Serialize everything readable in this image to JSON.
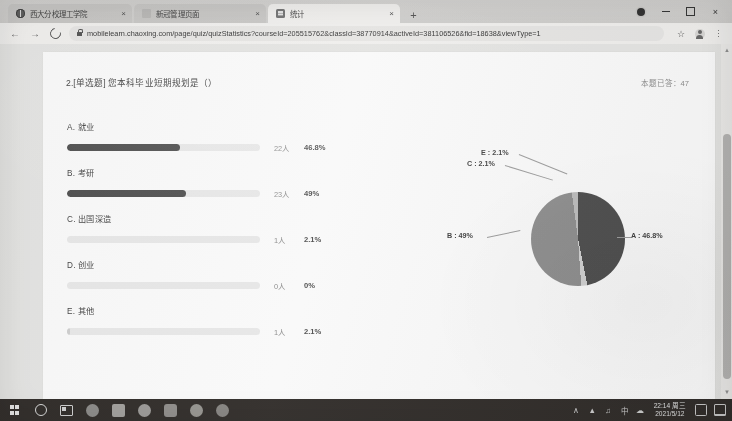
{
  "browser": {
    "tabs": [
      {
        "title": "西大分校理工学院",
        "icon": "globe-icon",
        "active": false
      },
      {
        "title": "新冠管理页面",
        "icon": "blank-page-icon",
        "active": false
      },
      {
        "title": "统计",
        "icon": "document-icon",
        "active": true
      }
    ],
    "new_tab_label": "+",
    "close_tab_label": "×",
    "back_label": "←",
    "forward_label": "→",
    "reload_label": "reload-icon",
    "url": "mobilelearn.chaoxing.com/page/quiz/quizStatistics?courseId=205515762&classId=38770914&activeId=381106526&fid=18638&viewType=1",
    "bookmark_label": "☆",
    "menu_label": "kebab-menu-icon",
    "window_controls": {
      "badge": "profile-dot-icon",
      "minimize": "–",
      "maximize": "□",
      "close": "×"
    }
  },
  "page": {
    "question_title": "2.[单选题] 您本科毕业短期规划是（）",
    "answered_label": "本题已答：47",
    "options": [
      {
        "key": "A",
        "text": "A. 就业",
        "count": "22人",
        "percent": "46.8%",
        "pct_value": 46.8
      },
      {
        "key": "B",
        "text": "B. 考研",
        "count": "23人",
        "percent": "49%",
        "pct_value": 49.0
      },
      {
        "key": "C",
        "text": "C. 出国深造",
        "count": "1人",
        "percent": "2.1%",
        "pct_value": 2.1
      },
      {
        "key": "D",
        "text": "D. 创业",
        "count": "0人",
        "percent": "0%",
        "pct_value": 0.0
      },
      {
        "key": "E",
        "text": "E. 其他",
        "count": "1人",
        "percent": "2.1%",
        "pct_value": 2.1
      }
    ],
    "pie_labels": {
      "a": "A : 46.8%",
      "b": "B : 49%",
      "c": "C : 2.1%",
      "e": "E : 2.1%"
    }
  },
  "chart_data": {
    "type": "pie",
    "title": "2.[单选题] 您本科毕业短期规划是（）",
    "categories": [
      "A",
      "B",
      "C",
      "D",
      "E"
    ],
    "category_labels": [
      "就业",
      "考研",
      "出国深造",
      "创业",
      "其他"
    ],
    "values": [
      46.8,
      49.0,
      2.1,
      0.0,
      2.1
    ],
    "counts": [
      22,
      23,
      1,
      0,
      1
    ],
    "total_responses": 47,
    "unit": "%",
    "legend": "outside-labels",
    "colors": [
      "#4a4a4a",
      "#8d8d8d",
      "#d2d2d2",
      "#e8e8e8",
      "#bdbdbd"
    ],
    "annotations": [
      "A : 46.8%",
      "B : 49%",
      "C : 2.1%",
      "E : 2.1%"
    ]
  },
  "taskbar": {
    "start_label": "start-icon",
    "search_label": "search-circle-icon",
    "taskview_label": "task-view-icon",
    "apps": [
      "app-icon-1",
      "app-icon-2",
      "app-icon-3",
      "app-icon-4",
      "app-icon-5",
      "app-icon-6"
    ],
    "tray": {
      "chevron": "∧",
      "network": "network-icon",
      "volume": "volume-icon",
      "ime": "中",
      "cloud": "cloud-icon",
      "time": "22:14 周三",
      "date": "2021/5/12",
      "action_center": "action-center-icon",
      "notification": "notification-icon"
    }
  }
}
